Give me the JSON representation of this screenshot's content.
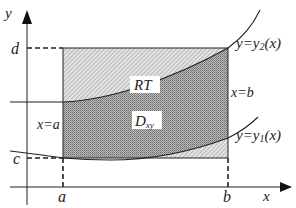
{
  "diagram": {
    "axes": {
      "x_label": "x",
      "y_label": "y"
    },
    "ticks": {
      "x": [
        "a",
        "b"
      ],
      "y": [
        "c",
        "d"
      ]
    },
    "boundary_labels": {
      "left": "x=a",
      "right": "x=b",
      "upper_curve": "y=y",
      "upper_curve_sub": "2",
      "upper_curve_tail": "(x)",
      "lower_curve": "y=y",
      "lower_curve_sub": "1",
      "lower_curve_tail": "(x)"
    },
    "regions": {
      "rectangle": "RT",
      "domain": "D",
      "domain_sub": "xy"
    },
    "colors": {
      "line": "#222222",
      "domain_fill": "#9a9a9a",
      "rect_fill": "#cfcfcf"
    }
  }
}
